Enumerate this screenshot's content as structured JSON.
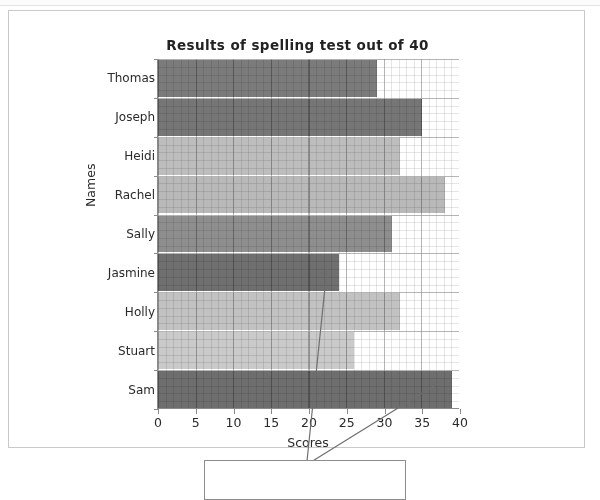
{
  "chart_data": {
    "type": "bar",
    "orientation": "horizontal",
    "title": "Results of spelling test out of 40",
    "xlabel": "Scores",
    "ylabel": "Names",
    "categories": [
      "Thomas",
      "Joseph",
      "Heidi",
      "Rachel",
      "Sally",
      "Jasmine",
      "Holly",
      "Stuart",
      "Sam"
    ],
    "values": [
      29,
      35,
      32,
      38,
      31,
      24,
      32,
      26,
      39
    ],
    "xlim": [
      0,
      40
    ],
    "xticks": [
      0,
      5,
      10,
      15,
      20,
      25,
      30,
      35,
      40
    ],
    "xtick_labels": [
      "0",
      "5",
      "10",
      "15",
      "20",
      "25",
      "30",
      "35",
      "40"
    ],
    "grid": true,
    "legend": "none",
    "bar_colors": [
      "#7b7b7b",
      "#767676",
      "#bdbdbd",
      "#b9b9b9",
      "#8e8e8e",
      "#6f6f6f",
      "#c2c2c2",
      "#cacaca",
      "#6e6e6e"
    ]
  },
  "annotations": {
    "leader_lines": [
      {
        "name": "leader-line-jasmine",
        "x1": 327,
        "y1": 268,
        "x2": 307,
        "y2": 461
      },
      {
        "name": "leader-line-sam",
        "x1": 440,
        "y1": 382,
        "x2": 311,
        "y2": 462
      }
    ],
    "callout_box": {
      "label": ""
    }
  },
  "page": {
    "background_color": "#ffffff",
    "frame_color": "#c9c9c9"
  }
}
